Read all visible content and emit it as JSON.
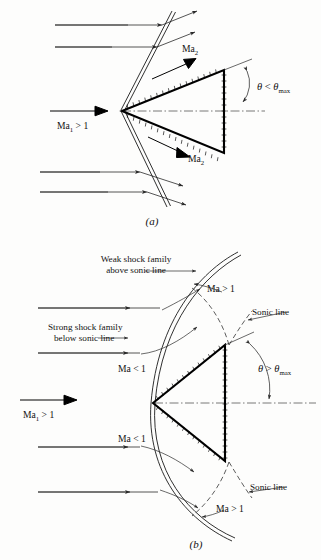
{
  "figure": {
    "title_absent": true,
    "panels": [
      {
        "tag": "(a)",
        "description": "Attached oblique shocks on a wedge at deflection angle less than maximum",
        "labels": {
          "upstream_mach": "Ma",
          "upstream_mach_sub": "1",
          "upstream_relation": "> 1",
          "downstream_mach_upper": "Ma",
          "downstream_mach_upper_sub": "2",
          "downstream_mach_lower": "Ma",
          "downstream_mach_lower_sub": "2",
          "angle_symbol": "θ",
          "angle_relation": "<",
          "angle_limit": "θ",
          "angle_limit_sub": "max"
        }
      },
      {
        "tag": "(b)",
        "description": "Detached bow shock on a wedge at deflection angle greater than maximum",
        "labels": {
          "upstream_mach": "Ma",
          "upstream_mach_sub": "1",
          "upstream_relation": "> 1",
          "weak_family_line1": "Weak shock family",
          "weak_family_line2": "above sonic line",
          "strong_family_line1": "Strong shock family",
          "strong_family_line2": "below sonic line",
          "sonic_line_upper": "Sonic line",
          "sonic_line_lower": "Sonic line",
          "mach_supersonic_upper": "Ma > 1",
          "mach_subsonic_upper": "Ma < 1",
          "mach_subsonic_lower": "Ma < 1",
          "mach_supersonic_lower": "Ma > 1",
          "angle_symbol": "θ",
          "angle_relation": ">",
          "angle_limit": "θ",
          "angle_limit_sub": "max"
        }
      }
    ],
    "colors": {
      "background": "#fdfdfc",
      "ink": "#111111",
      "line": "#2a2a2a",
      "axis": "#555555"
    }
  }
}
